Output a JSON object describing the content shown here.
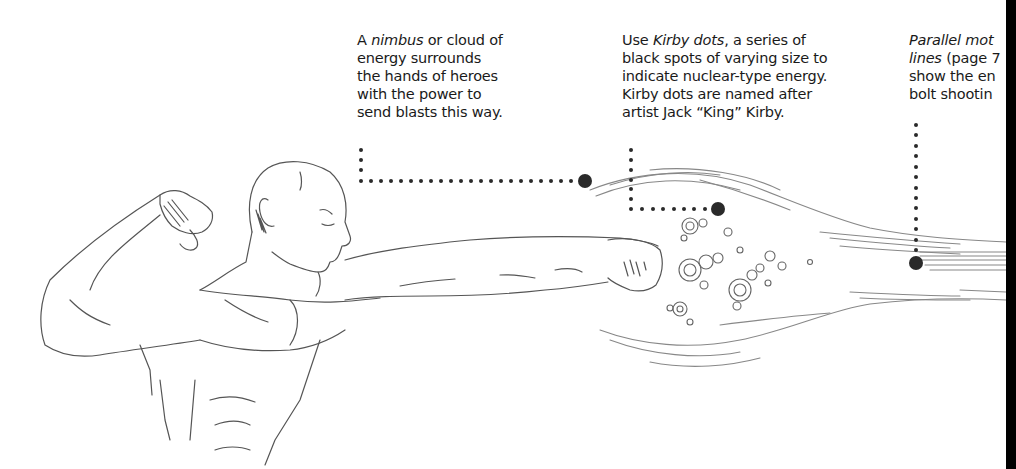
{
  "page": {
    "background": "#ffffff",
    "text_color": "#1a1a1a",
    "leader_color": "#2a2a2a"
  },
  "captions": [
    {
      "id": "nimbus",
      "lines": [
        {
          "pre": "A ",
          "em": "nimbus",
          "post": " or cloud of"
        },
        {
          "pre": "energy surrounds",
          "em": "",
          "post": ""
        },
        {
          "pre": "the hands of heroes",
          "em": "",
          "post": ""
        },
        {
          "pre": "with the power to",
          "em": "",
          "post": ""
        },
        {
          "pre": "send blasts this way.",
          "em": "",
          "post": ""
        }
      ]
    },
    {
      "id": "kirby-dots",
      "lines": [
        {
          "pre": "Use ",
          "em": "Kirby dots",
          "post": ", a series of"
        },
        {
          "pre": "black spots of varying size to",
          "em": "",
          "post": ""
        },
        {
          "pre": "indicate nuclear-type energy.",
          "em": "",
          "post": ""
        },
        {
          "pre": "Kirby dots are named after",
          "em": "",
          "post": ""
        },
        {
          "pre": "artist Jack “King” Kirby.",
          "em": "",
          "post": ""
        }
      ]
    },
    {
      "id": "motion-lines",
      "lines": [
        {
          "pre": "",
          "em": "Parallel mot",
          "post": ""
        },
        {
          "pre": "",
          "em": "lines",
          "post": " (page 7"
        },
        {
          "pre": "show the en",
          "em": "",
          "post": ""
        },
        {
          "pre": "bolt shootin",
          "em": "",
          "post": ""
        }
      ]
    }
  ],
  "illustration": {
    "subject": "muscular hero punching with energy blast",
    "icons": [
      "hero-figure-icon",
      "energy-blast-icon",
      "kirby-dots-icon",
      "leader-line-icon"
    ]
  }
}
